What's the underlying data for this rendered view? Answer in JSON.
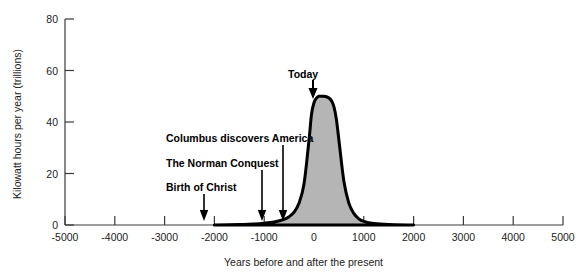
{
  "chart_data": {
    "type": "area",
    "title": "",
    "xlabel": "Years before and after the present",
    "ylabel": "Kilowatt hours per year (trillions)",
    "xlim": [
      -5000,
      5000
    ],
    "ylim": [
      0,
      80
    ],
    "xticks": [
      -5000,
      -4000,
      -3000,
      -2000,
      -1000,
      0,
      1000,
      2000,
      3000,
      4000,
      5000
    ],
    "xtick_labels": [
      "-5000",
      "-4000",
      "-3000",
      "-2000",
      "-1000",
      "0",
      "1000",
      "2000",
      "3000",
      "4000",
      "5000"
    ],
    "yticks": [
      0,
      20,
      40,
      60,
      80
    ],
    "ytick_labels": [
      "0",
      "20",
      "40",
      "60",
      "80"
    ],
    "grid": false,
    "legend": false,
    "series_name": "World energy consumption",
    "fill_color": "#b5b5b5",
    "line_color": "#000000",
    "x": [
      -5000,
      -4000,
      -3000,
      -2000,
      -1500,
      -1200,
      -1000,
      -800,
      -600,
      -500,
      -400,
      -300,
      -200,
      -100,
      -50,
      0,
      50,
      100,
      150,
      200,
      250,
      300,
      350,
      400,
      450,
      500,
      600,
      700,
      800,
      900,
      1000,
      1200,
      1500,
      2000,
      3000,
      4000,
      5000
    ],
    "y": [
      0,
      0,
      0,
      0,
      0.2,
      0.4,
      0.7,
      1.2,
      2.2,
      3.2,
      5.0,
      8.5,
      16,
      33,
      43,
      47.5,
      49.3,
      50,
      50,
      50,
      49.8,
      49.3,
      48.3,
      46,
      41,
      33,
      17,
      8.5,
      4.5,
      2.4,
      1.4,
      0.6,
      0.2,
      0,
      0,
      0,
      0
    ],
    "peak_value": 50,
    "peak_x": 150,
    "annotations": [
      {
        "label": "Today",
        "x": 0,
        "text_x": 288,
        "text_y": 68,
        "arrow_x": 313,
        "arrow_y0": 80,
        "arrow_y1": 97
      },
      {
        "label": "Columbus discovers America",
        "x": -500,
        "text_x": 166,
        "text_y": 132,
        "arrow_x": 283,
        "arrow_y0": 145,
        "arrow_y1": 221
      },
      {
        "label": "The Norman Conquest",
        "x": -930,
        "text_x": 166,
        "text_y": 157,
        "arrow_x": 262,
        "arrow_y0": 170,
        "arrow_y1": 221
      },
      {
        "label": "Birth of Christ",
        "x": -2000,
        "text_x": 166,
        "text_y": 181,
        "arrow_x": 204,
        "arrow_y0": 194,
        "arrow_y1": 221
      }
    ]
  },
  "axes": {
    "y_title": "Kilowatt hours per year (trillions)",
    "x_title": "Years before and after the present",
    "y_labels": [
      "80",
      "60",
      "40",
      "20",
      "0"
    ],
    "x_labels": [
      "-5000",
      "-4000",
      "-3000",
      "-2000",
      "-1000",
      "0",
      "1000",
      "2000",
      "3000",
      "4000",
      "5000"
    ]
  },
  "annotations": {
    "today": "Today",
    "columbus": "Columbus discovers America",
    "norman": "The Norman Conquest",
    "birth": "Birth of Christ"
  }
}
